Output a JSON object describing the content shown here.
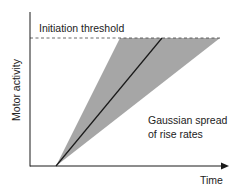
{
  "diagram": {
    "threshold_label": "Initiation threshold",
    "y_axis_label": "Motor activity",
    "x_axis_label": "Time",
    "spread_label_line1": "Gaussian spread",
    "spread_label_line2": "of rise rates",
    "colors": {
      "axis": "#1a1a1a",
      "fan_fill": "#a6a6a6",
      "mean_line": "#1a1a1a",
      "threshold_dash": "#444444"
    }
  }
}
